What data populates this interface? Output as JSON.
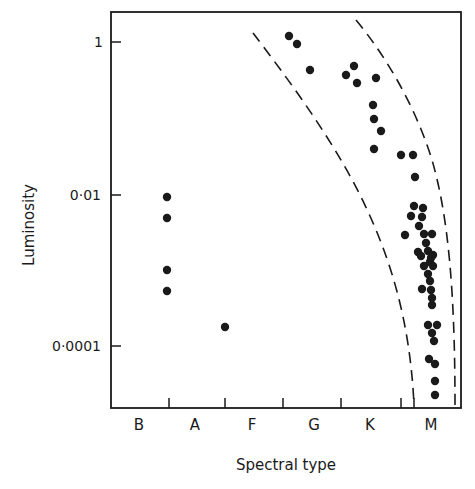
{
  "chart_data": {
    "type": "scatter",
    "title": "",
    "xlabel": "Spectral type",
    "ylabel": "Luminosity",
    "y_scale": "log",
    "ylim": [
      5e-06,
      3
    ],
    "y_ticks": [
      {
        "value": 1,
        "label": "1"
      },
      {
        "value": 0.01,
        "label": "0·01"
      },
      {
        "value": 0.0001,
        "label": "0·0001"
      }
    ],
    "x_categories": [
      "B",
      "A",
      "F",
      "G",
      "K",
      "M"
    ],
    "grid": false,
    "legend": null,
    "series": [
      {
        "name": "stars",
        "marker": "filled-circle",
        "color": "#1a1a1a",
        "points": [
          {
            "type": "A0",
            "luminosity": 0.0095
          },
          {
            "type": "A0",
            "luminosity": 0.0052
          },
          {
            "type": "A0",
            "luminosity": 0.0011
          },
          {
            "type": "A0",
            "luminosity": 0.00058
          },
          {
            "type": "F0",
            "luminosity": 0.00019
          },
          {
            "type": "G0",
            "luminosity": 1.2
          },
          {
            "type": "G1",
            "luminosity": 0.95
          },
          {
            "type": "G3",
            "luminosity": 0.44
          },
          {
            "type": "K0",
            "luminosity": 0.38
          },
          {
            "type": "K1",
            "luminosity": 0.5
          },
          {
            "type": "K1",
            "luminosity": 0.29
          },
          {
            "type": "K4",
            "luminosity": 0.35
          },
          {
            "type": "K4",
            "luminosity": 0.15
          },
          {
            "type": "K4",
            "luminosity": 0.1
          },
          {
            "type": "K5",
            "luminosity": 0.067
          },
          {
            "type": "K4",
            "luminosity": 0.039
          },
          {
            "type": "M0",
            "luminosity": 0.031
          },
          {
            "type": "M1",
            "luminosity": 0.031
          },
          {
            "type": "M1",
            "luminosity": 0.016
          },
          {
            "type": "M1",
            "luminosity": 0.0075
          },
          {
            "type": "M2",
            "luminosity": 0.0069
          },
          {
            "type": "M1",
            "luminosity": 0.0055
          },
          {
            "type": "M2",
            "luminosity": 0.0054
          },
          {
            "type": "M2",
            "luminosity": 0.0042
          },
          {
            "type": "M0",
            "luminosity": 0.0032
          },
          {
            "type": "M2",
            "luminosity": 0.0033
          },
          {
            "type": "M3",
            "luminosity": 0.0033
          },
          {
            "type": "M2",
            "luminosity": 0.0025
          },
          {
            "type": "M2",
            "luminosity": 0.0019
          },
          {
            "type": "M2",
            "luminosity": 0.0018
          },
          {
            "type": "M3",
            "luminosity": 0.0016
          },
          {
            "type": "M3",
            "luminosity": 0.0013
          },
          {
            "type": "M2",
            "luminosity": 0.0013
          },
          {
            "type": "M3",
            "luminosity": 0.0011
          },
          {
            "type": "M3",
            "luminosity": 0.00088
          },
          {
            "type": "M3",
            "luminosity": 0.00073
          },
          {
            "type": "M2",
            "luminosity": 0.00058
          },
          {
            "type": "M3",
            "luminosity": 0.00056
          },
          {
            "type": "M3",
            "luminosity": 0.00044
          },
          {
            "type": "M3",
            "luminosity": 0.00036
          },
          {
            "type": "M3",
            "luminosity": 0.00026
          },
          {
            "type": "M4",
            "luminosity": 0.00026
          },
          {
            "type": "M3",
            "luminosity": 0.0002
          },
          {
            "type": "M3",
            "luminosity": 0.00016
          },
          {
            "type": "M3",
            "luminosity": 9.5e-05
          },
          {
            "type": "M4",
            "luminosity": 8.1e-05
          },
          {
            "type": "M4",
            "luminosity": 4.9e-05
          },
          {
            "type": "M4",
            "luminosity": 3.3e-05
          }
        ]
      }
    ],
    "annotations": [
      {
        "kind": "dashed-curve",
        "name": "inner-boundary",
        "description": "left dashed envelope curving from upper G down to late K/M"
      },
      {
        "kind": "dashed-curve",
        "name": "outer-boundary",
        "description": "right dashed envelope curving from K down to late M"
      }
    ]
  },
  "render": {
    "frame": {
      "x0": 111,
      "y0": 12,
      "x1": 461,
      "y1": 408
    },
    "y_ticks_px": [
      {
        "y": 42,
        "label": "1",
        "lx": 103
      },
      {
        "y": 195,
        "label": "0·01",
        "lx": 101
      },
      {
        "y": 346,
        "label": "0·0001",
        "lx": 101
      }
    ],
    "x_ticks_px": [
      169,
      225,
      283,
      341,
      401,
      414
    ],
    "x_labels_px": [
      {
        "x": 139,
        "label": "B"
      },
      {
        "x": 195,
        "label": "A"
      },
      {
        "x": 252,
        "label": "F"
      },
      {
        "x": 314,
        "label": "G"
      },
      {
        "x": 370,
        "label": "K"
      },
      {
        "x": 431,
        "label": "M"
      }
    ],
    "points_px": [
      [
        167,
        197
      ],
      [
        167,
        218
      ],
      [
        167,
        270
      ],
      [
        167,
        291
      ],
      [
        225,
        327
      ],
      [
        289,
        36
      ],
      [
        297,
        44
      ],
      [
        310,
        70
      ],
      [
        346,
        75
      ],
      [
        354,
        66
      ],
      [
        357,
        83
      ],
      [
        376,
        78
      ],
      [
        373,
        105
      ],
      [
        374,
        119
      ],
      [
        381,
        131
      ],
      [
        374,
        149
      ],
      [
        401,
        155
      ],
      [
        413,
        155
      ],
      [
        415,
        177
      ],
      [
        414,
        206
      ],
      [
        423,
        208
      ],
      [
        411,
        216
      ],
      [
        422,
        217
      ],
      [
        419,
        226
      ],
      [
        405,
        235
      ],
      [
        424,
        234
      ],
      [
        432,
        234
      ],
      [
        426,
        243
      ],
      [
        418,
        252
      ],
      [
        428,
        251
      ],
      [
        433,
        255
      ],
      [
        430,
        262
      ],
      [
        421,
        256
      ],
      [
        431,
        258
      ],
      [
        424,
        266
      ],
      [
        433,
        266
      ],
      [
        428,
        274
      ],
      [
        430,
        281
      ],
      [
        422,
        289
      ],
      [
        431,
        290
      ],
      [
        432,
        298
      ],
      [
        432,
        305
      ],
      [
        428,
        325
      ],
      [
        437,
        325
      ],
      [
        432,
        333
      ],
      [
        434,
        341
      ],
      [
        429,
        359
      ],
      [
        435,
        364
      ],
      [
        435,
        381
      ],
      [
        435,
        395
      ]
    ],
    "inner_curve": "M253,33 C285,75 330,135 360,195 C390,255 410,320 414,405",
    "outer_curve": "M356,20 C385,55 415,105 432,160 C448,215 455,290 455,405"
  }
}
